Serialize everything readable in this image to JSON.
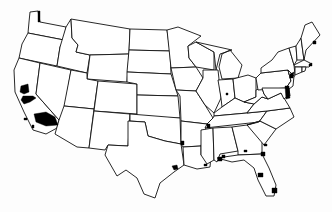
{
  "map": {
    "title": "",
    "type": "choropleth",
    "region": "Contiguous United States",
    "colors": {
      "background": "#fdfdfd",
      "state_fill": "#ffffff",
      "border": "#111111",
      "highlight": "#000000"
    },
    "states": [
      {
        "id": "WA",
        "d": "M30,12 L38,11 L40,22 L66,27 L64,40 L28,33 L29,22 Z"
      },
      {
        "id": "OR",
        "d": "M28,33 L64,40 L60,47 L57,66 L19,58 L22,44 Z"
      },
      {
        "id": "CA",
        "d": "M19,58 L40,63 L36,94 L59,120 L57,128 L46,134 L33,130 L24,112 L15,92 L14,70 Z"
      },
      {
        "id": "ID",
        "d": "M66,27 L71,19 L72,38 L78,45 L76,52 L90,55 L87,73 L57,66 L60,47 Z"
      },
      {
        "id": "NV",
        "d": "M40,63 L71,70 L64,113 L59,120 L36,94 Z"
      },
      {
        "id": "MT",
        "d": "M71,19 L130,29 L129,54 L90,55 L76,52 L78,45 L72,38 Z"
      },
      {
        "id": "WY",
        "d": "M90,55 L129,54 L127,82 L87,79 Z"
      },
      {
        "id": "UT",
        "d": "M71,70 L87,73 L87,79 L98,81 L94,109 L64,106 Z"
      },
      {
        "id": "AZ",
        "d": "M64,106 L94,109 L89,148 L77,147 L55,134 L59,120 Z"
      },
      {
        "id": "CO",
        "d": "M98,81 L137,84 L137,114 L94,111 Z"
      },
      {
        "id": "NM",
        "d": "M94,111 L130,114 L128,146 L108,145 L105,150 L89,148 Z"
      },
      {
        "id": "ND",
        "d": "M130,29 L167,30 L170,51 L129,50 Z"
      },
      {
        "id": "SD",
        "d": "M129,50 L170,51 L171,74 L127,72 Z"
      },
      {
        "id": "NE",
        "d": "M127,72 L171,74 L178,96 L137,95 L137,84 L127,82 Z"
      },
      {
        "id": "KS",
        "d": "M137,95 L178,96 L180,118 L137,118 Z"
      },
      {
        "id": "OK",
        "d": "M130,114 L180,118 L181,144 L165,141 L148,136 L145,122 L130,121 Z"
      },
      {
        "id": "TX",
        "d": "M128,121 L145,122 L148,136 L165,141 L181,144 L184,165 L174,172 L160,183 L155,198 L144,194 L137,178 L126,170 L117,176 L105,155 L108,145 L128,146 Z"
      },
      {
        "id": "MN",
        "d": "M167,30 L178,27 L201,36 L188,46 L189,58 L196,67 L171,68 Z"
      },
      {
        "id": "IA",
        "d": "M171,68 L196,67 L203,78 L196,91 L176,90 Z"
      },
      {
        "id": "MO",
        "d": "M176,90 L196,91 L205,105 L213,118 L207,124 L181,121 L180,96 Z"
      },
      {
        "id": "AR",
        "d": "M181,121 L207,124 L201,146 L183,147 L181,144 Z"
      },
      {
        "id": "LA",
        "d": "M183,147 L201,146 L201,155 L211,155 L210,167 L197,169 L184,165 Z"
      },
      {
        "id": "WI",
        "d": "M188,46 L196,42 L214,52 L214,70 L196,67 L189,58 Z"
      },
      {
        "id": "IL",
        "d": "M203,70 L218,70 L221,98 L214,113 L205,105 L196,91 L203,78 Z"
      },
      {
        "id": "MI",
        "d": "M196,42 L214,46 L232,50 L220,54 L216,70 L214,52 Z M222,54 L230,50 L242,65 L238,78 L222,79 L219,67 Z"
      },
      {
        "id": "IN",
        "d": "M218,80 L233,79 L235,98 L222,107 L221,98 Z"
      },
      {
        "id": "OH",
        "d": "M233,79 L248,75 L256,78 L256,97 L244,102 L235,98 Z"
      },
      {
        "id": "KY",
        "d": "M214,113 L222,107 L235,98 L244,102 L254,104 L247,113 L214,116 Z"
      },
      {
        "id": "TN",
        "d": "M207,124 L213,118 L214,116 L247,113 L267,111 L259,122 L205,128 Z"
      },
      {
        "id": "MS",
        "d": "M201,130 L213,128 L214,160 L207,164 L201,155 Z"
      },
      {
        "id": "AL",
        "d": "M213,128 L232,127 L238,151 L220,154 L217,162 L214,160 Z"
      },
      {
        "id": "GA",
        "d": "M232,127 L247,125 L262,140 L262,154 L238,155 L238,151 Z"
      },
      {
        "id": "FL",
        "d": "M217,158 L238,155 L262,154 L269,168 L276,185 L274,196 L266,196 L258,180 L254,168 L244,160 L232,162 Z"
      },
      {
        "id": "SC",
        "d": "M247,125 L260,121 L276,129 L264,145 Z"
      },
      {
        "id": "NC",
        "d": "M259,122 L267,111 L290,108 L294,117 L276,129 L260,121 L247,125 Z"
      },
      {
        "id": "VA",
        "d": "M247,113 L254,104 L262,97 L268,99 L281,93 L290,108 L267,111 Z"
      },
      {
        "id": "WV",
        "d": "M256,97 L256,90 L262,88 L264,94 L268,99 L262,97 L254,104 L244,102 Z"
      },
      {
        "id": "PA",
        "d": "M256,78 L261,73 L288,70 L291,81 L286,88 L258,90 Z"
      },
      {
        "id": "NY",
        "d": "M261,68 L272,60 L278,52 L289,48 L294,65 L295,75 L291,81 L288,70 L261,73 Z"
      },
      {
        "id": "MD",
        "d": "M262,88 L286,88 L289,95 L284,99 L281,93 L268,99 L264,94 Z"
      },
      {
        "id": "NJ",
        "d": "M288,70 L294,76 L293,86 L289,89 L286,88 L291,81 Z"
      },
      {
        "id": "DE",
        "d": "M286,88 L289,89 L290,96 L289,95 Z"
      },
      {
        "id": "VT",
        "d": "M289,48 L296,46 L297,60 L294,65 Z"
      },
      {
        "id": "NH",
        "d": "M296,46 L301,38 L304,60 L297,60 Z"
      },
      {
        "id": "ME",
        "d": "M301,38 L305,25 L312,22 L320,35 L306,50 L304,60 Z"
      },
      {
        "id": "MA",
        "d": "M294,65 L304,60 L312,64 L309,67 L295,67 Z"
      },
      {
        "id": "CT",
        "d": "M295,67 L302,67 L302,72 L295,75 Z"
      },
      {
        "id": "RI",
        "d": "M302,67 L306,67 L305,71 L302,72 Z"
      }
    ],
    "highlighted_areas": [
      {
        "name": "SF Bay Area",
        "d": "M21,86 L28,84 L29,92 L24,94 L20,92 Z"
      },
      {
        "name": "Central Valley",
        "d": "M23,96 L33,96 L36,98 L30,102 L24,104 L21,100 Z"
      },
      {
        "name": "Southern California",
        "d": "M34,114 L46,112 L55,117 L58,125 L46,126 L36,122 Z"
      },
      {
        "name": "Channel Islands 1",
        "d": "M24,118 L27,118 L27,120 L24,120 Z"
      },
      {
        "name": "Channel Islands 2",
        "d": "M32,125 L34,125 L34,128 L32,128 Z"
      },
      {
        "name": "Puget Sound",
        "d": "M38,11 L40,11 L40,22 L38,22 Z"
      },
      {
        "name": "Houston",
        "d": "M172,166 L177,165 L178,169 L174,170 Z"
      },
      {
        "name": "New Orleans",
        "d": "M218,157 L222,157 L222,161 L218,161 Z"
      },
      {
        "name": "Mobile",
        "d": "M222,155 L225,155 L225,158 L222,158 Z"
      },
      {
        "name": "Baton Rouge",
        "d": "M204,164 L207,164 L207,166 L204,166 Z"
      },
      {
        "name": "Memphis",
        "d": "M207,124 L210,124 L210,128 L207,128 Z"
      },
      {
        "name": "Shreveport",
        "d": "M181,141 L184,141 L184,145 L181,145 Z"
      },
      {
        "name": "Savannah",
        "d": "M261,152 L265,152 L265,156 L261,156 Z"
      },
      {
        "name": "Charleston",
        "d": "M264,144 L267,144 L267,146 L264,146 Z"
      },
      {
        "name": "Atlanta",
        "d": "M244,150 L247,150 L247,152 L244,152 Z"
      },
      {
        "name": "Tampa",
        "d": "M258,173 L263,173 L263,177 L258,177 Z"
      },
      {
        "name": "Miami",
        "d": "M272,188 L277,188 L277,193 L272,193 Z"
      },
      {
        "name": "Indianapolis",
        "d": "M226,93 L228,93 L228,95 L226,95 Z"
      },
      {
        "name": "Chesapeake",
        "d": "M285,86 L289,86 L290,98 L286,99 Z"
      },
      {
        "name": "New York City",
        "d": "M290,74 L294,72 L293,78 L290,78 Z"
      },
      {
        "name": "Maine Coast",
        "d": "M313,41 L316,41 L316,44 L313,44 Z"
      },
      {
        "name": "Boston",
        "d": "M309,64 L312,63 L312,66 L309,66 Z"
      }
    ]
  }
}
